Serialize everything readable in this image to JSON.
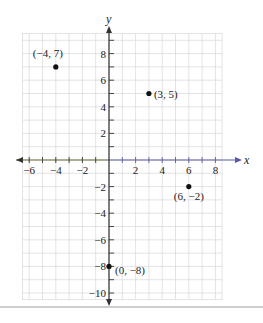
{
  "chart_data": {
    "type": "scatter",
    "title": "",
    "xlabel": "x",
    "ylabel": "y",
    "xlim": [
      -6.5,
      8.5
    ],
    "ylim": [
      -10.5,
      9.5
    ],
    "grid": true,
    "x_ticks": [
      -6,
      -4,
      -2,
      2,
      4,
      6,
      8
    ],
    "y_ticks": [
      8,
      6,
      4,
      2,
      -2,
      -4,
      -6,
      -8,
      -10
    ],
    "x_tick_labels": [
      "−6",
      "−4",
      "−2",
      "2",
      "4",
      "6",
      "8"
    ],
    "y_tick_labels": [
      "8",
      "6",
      "4",
      "2",
      "−2",
      "−4",
      "−6",
      "−8",
      "−10"
    ],
    "points": [
      {
        "x": -4,
        "y": 7,
        "label": "(−4, 7)"
      },
      {
        "x": 3,
        "y": 5,
        "label": "(3, 5)"
      },
      {
        "x": 6,
        "y": -2,
        "label": "(6, −2)"
      },
      {
        "x": 0,
        "y": -8,
        "label": "(0, −8)"
      }
    ]
  },
  "colors": {
    "grid": "#dcdcdc",
    "axis_x": "#5a5aa8",
    "axis_x_left": "#333333",
    "axis_y": "#333333",
    "point": "#111111",
    "text": "#222222"
  }
}
